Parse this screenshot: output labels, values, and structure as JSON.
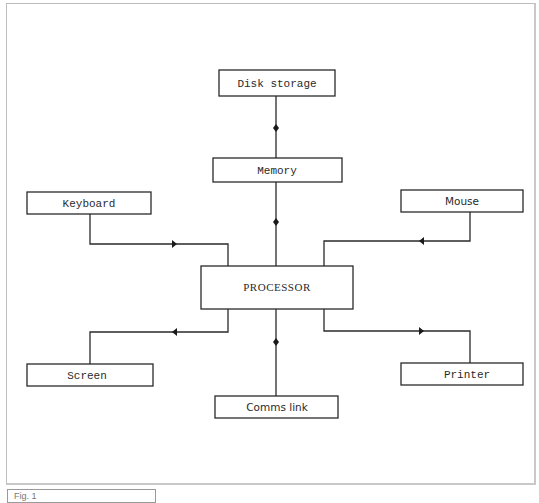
{
  "diagram": {
    "title": "",
    "nodes": [
      {
        "id": "disk",
        "label": "Disk storage"
      },
      {
        "id": "memory",
        "label": "Memory"
      },
      {
        "id": "keyboard",
        "label": "Keyboard"
      },
      {
        "id": "mouse",
        "label": "Mouse"
      },
      {
        "id": "processor",
        "label": "PROCESSOR"
      },
      {
        "id": "screen",
        "label": "Screen"
      },
      {
        "id": "printer",
        "label": "Printer"
      },
      {
        "id": "comms",
        "label": "Comms link"
      }
    ],
    "edges": [
      {
        "from": "disk",
        "to": "memory",
        "type": "bidirectional",
        "marker": "diamond"
      },
      {
        "from": "memory",
        "to": "processor",
        "type": "bidirectional",
        "marker": "diamond"
      },
      {
        "from": "keyboard",
        "to": "processor",
        "type": "input",
        "marker": "arrow-right"
      },
      {
        "from": "mouse",
        "to": "processor",
        "type": "input",
        "marker": "arrow-left"
      },
      {
        "from": "processor",
        "to": "screen",
        "type": "output",
        "marker": "arrow-left"
      },
      {
        "from": "processor",
        "to": "printer",
        "type": "output",
        "marker": "arrow-right"
      },
      {
        "from": "processor",
        "to": "comms",
        "type": "bidirectional",
        "marker": "diamond"
      }
    ]
  },
  "caption": {
    "text": "Fig. 1"
  }
}
